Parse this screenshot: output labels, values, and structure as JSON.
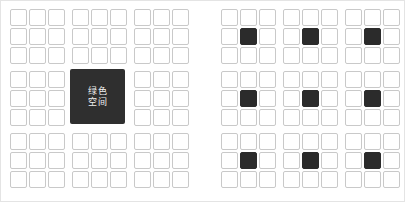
{
  "figure": {
    "background_color": "#ffffff",
    "border_color": "#e4e4e4",
    "cell_light_fill": "#ffffff",
    "cell_light_border": "#c9c9c9",
    "cell_dark_fill": "#2b2b2b",
    "merged_block_fill": "#2f2f2f",
    "label_color": "#f2f2f2"
  },
  "panels": [
    {
      "id": "left-panel",
      "name": "grid-with-central-green-space",
      "rows": 9,
      "columns": 9,
      "block_rows": 3,
      "block_columns": 3,
      "merged_block": {
        "block_row": 1,
        "block_column": 1,
        "label_lines": [
          "绿色",
          "空间"
        ],
        "label_text": "绿色空间"
      },
      "dark_cells": []
    },
    {
      "id": "right-panel",
      "name": "grid-with-distributed-green-spaces",
      "rows": 9,
      "columns": 9,
      "block_rows": 3,
      "block_columns": 3,
      "merged_block": null,
      "dark_cells": [
        [
          1,
          1
        ],
        [
          1,
          4
        ],
        [
          1,
          7
        ],
        [
          4,
          1
        ],
        [
          4,
          4
        ],
        [
          4,
          7
        ],
        [
          7,
          1
        ],
        [
          7,
          4
        ],
        [
          7,
          7
        ]
      ]
    }
  ]
}
